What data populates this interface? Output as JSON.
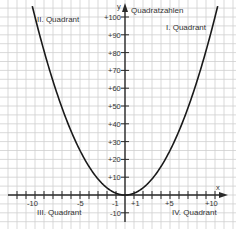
{
  "chart_data": {
    "type": "line",
    "title": "Quadratzahlen",
    "xlabel": "x",
    "ylabel": "y",
    "function": "y = x^2",
    "xlim": [
      -12,
      11.5
    ],
    "ylim": [
      -15,
      103
    ],
    "grid": true,
    "x_ticks": [
      "-10",
      "-5",
      "-1",
      "+1",
      "+5",
      "+10"
    ],
    "y_ticks": [
      "+100",
      "+90",
      "+80",
      "+70",
      "+60",
      "+50",
      "+40",
      "+30",
      "+20",
      "+10",
      "-10"
    ],
    "series": [
      {
        "name": "Quadratzahlen",
        "x": [
          -10,
          -9,
          -8,
          -7,
          -6,
          -5,
          -4,
          -3,
          -2,
          -1,
          0,
          1,
          2,
          3,
          4,
          5,
          6,
          7,
          8,
          9,
          10
        ],
        "values": [
          100,
          81,
          64,
          49,
          36,
          25,
          16,
          9,
          4,
          1,
          0,
          1,
          4,
          9,
          16,
          25,
          36,
          49,
          64,
          81,
          100
        ]
      }
    ],
    "annotations": [
      "I. Quadrant",
      "II. Quadrant",
      "III. Quadrant",
      "IV. Quadrant"
    ],
    "colors": {
      "curve": "#1a1a1a",
      "axis": "#2a2a2a",
      "grid": "#c8c8c8",
      "text": "#333333"
    }
  },
  "labels": {
    "title": "Quadratzahlen",
    "x_axis": "x",
    "y_axis": "y",
    "quadrant_1": "I. Quadrant",
    "quadrant_2": "II. Quadrant",
    "quadrant_3": "III. Quadrant",
    "quadrant_4": "IV. Quadrant",
    "x_tick_m10": "-10",
    "x_tick_m5": "-5",
    "x_tick_m1": "-1",
    "x_tick_p1": "+1",
    "x_tick_p5": "+5",
    "x_tick_p10": "+10",
    "y_tick_100": "+100",
    "y_tick_90": "+90",
    "y_tick_80": "+80",
    "y_tick_70": "+70",
    "y_tick_60": "+60",
    "y_tick_50": "+50",
    "y_tick_40": "+40",
    "y_tick_30": "+30",
    "y_tick_20": "+20",
    "y_tick_10": "+10",
    "y_tick_m10": "-10"
  }
}
